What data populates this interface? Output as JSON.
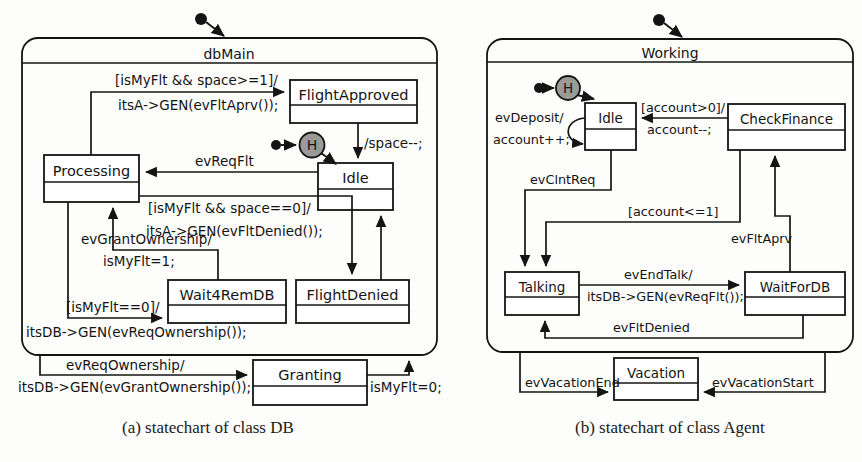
{
  "figure": {
    "caption_a": "(a) statechart of class DB",
    "caption_b": "(b) statechart of class Agent"
  },
  "diagram_a": {
    "composite_state": "dbMain",
    "history_marker": "H",
    "states": [
      {
        "id": "processing",
        "name": "Processing"
      },
      {
        "id": "flight_approved",
        "name": "FlightApproved"
      },
      {
        "id": "idle",
        "name": "Idle"
      },
      {
        "id": "wait4remdb",
        "name": "Wait4RemDB"
      },
      {
        "id": "flight_denied",
        "name": "FlightDenied"
      },
      {
        "id": "granting",
        "name": "Granting"
      }
    ],
    "transitions": [
      {
        "id": "t-approve",
        "line1": "[isMyFlt && space>=1]/",
        "line2": "itsA->GEN(evFltAprv());"
      },
      {
        "id": "t-space",
        "line1": "/space--;",
        "line2": ""
      },
      {
        "id": "t-reqflt",
        "line1": "evReqFlt",
        "line2": ""
      },
      {
        "id": "t-deny",
        "line1": "[isMyFlt && space==0]/",
        "line2": "itsA->GEN(evFltDenied());"
      },
      {
        "id": "t-grantown",
        "line1": "evGrantOwnership/",
        "line2": "isMyFlt=1;"
      },
      {
        "id": "t-reqown-in",
        "line1": "[isMyFlt==0]/",
        "line2": "itsDB->GEN(evReqOwnership());"
      },
      {
        "id": "t-reqown-out",
        "line1": "evReqOwnership/",
        "line2": "itsDB->GEN(evGrantOwnership());"
      },
      {
        "id": "t-ismyflt0",
        "line1": "isMyFlt=0;",
        "line2": ""
      }
    ]
  },
  "diagram_b": {
    "composite_state": "Working",
    "history_marker": "H",
    "states": [
      {
        "id": "idle",
        "name": "Idle"
      },
      {
        "id": "check_finance",
        "name": "CheckFinance"
      },
      {
        "id": "talking",
        "name": "Talking"
      },
      {
        "id": "waitfordb",
        "name": "WaitForDB"
      },
      {
        "id": "vacation",
        "name": "Vacation"
      }
    ],
    "transitions": [
      {
        "id": "t-deposit",
        "line1": "evDeposit/",
        "line2": "account++;"
      },
      {
        "id": "t-accountgt0",
        "line1": "[account>0]/",
        "line2": "account--;"
      },
      {
        "id": "t-clntreq",
        "line1": "evClntReq",
        "line2": ""
      },
      {
        "id": "t-accountle1",
        "line1": "[account<=1]",
        "line2": ""
      },
      {
        "id": "t-endtalk",
        "line1": "evEndTalk/",
        "line2": "itsDB->GEN(evReqFlt());"
      },
      {
        "id": "t-fltaprv",
        "line1": "evFltAprv",
        "line2": ""
      },
      {
        "id": "t-fltdenied",
        "line1": "evFltDenied",
        "line2": ""
      },
      {
        "id": "t-vacend",
        "line1": "evVacationEnd",
        "line2": ""
      },
      {
        "id": "t-vacstart",
        "line1": "evVacationStart",
        "line2": ""
      }
    ]
  },
  "colors": {
    "stroke": "#141414",
    "history_fill": "#9a9a9a",
    "background": "#fdfdfb"
  }
}
